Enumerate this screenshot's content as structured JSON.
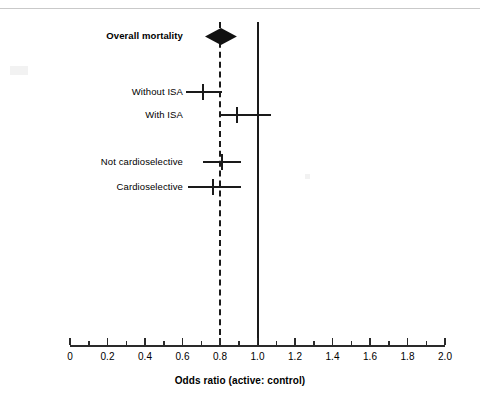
{
  "figure": {
    "background_color": "#ffffff",
    "line_color": "#1a1a1a"
  },
  "chart_data": {
    "type": "forest",
    "title": "",
    "xlabel": "Odds ratio (active: control)",
    "ylabel": "",
    "xlim": [
      0,
      2.0
    ],
    "grid": false,
    "legend": "none",
    "major_tick_step": 0.2,
    "minor_tick_step": 0.1,
    "tick_labels": [
      "0",
      "0.2",
      "0.4",
      "0.6",
      "0.8",
      "1.0",
      "1.2",
      "1.4",
      "1.6",
      "1.8",
      "2.0"
    ],
    "tick_values": [
      0,
      0.2,
      0.4,
      0.6,
      0.8,
      1.0,
      1.2,
      1.4,
      1.6,
      1.8,
      2.0
    ],
    "reference_lines": [
      {
        "name": "no-effect-line",
        "value": 1.0,
        "style": "solid"
      },
      {
        "name": "summary-effect-line",
        "value": 0.8,
        "style": "dashed"
      }
    ],
    "rows": [
      {
        "label": "Overall mortality",
        "marker": "diamond",
        "bold": true,
        "estimate": 0.8,
        "ci_low": 0.72,
        "ci_high": 0.89,
        "y": 36
      },
      {
        "label": "Without ISA",
        "marker": "line",
        "bold": false,
        "estimate": 0.71,
        "ci_low": 0.62,
        "ci_high": 0.81,
        "y": 92
      },
      {
        "label": "With ISA",
        "marker": "line",
        "bold": false,
        "estimate": 0.89,
        "ci_low": 0.8,
        "ci_high": 1.07,
        "y": 115
      },
      {
        "label": "Not cardioselective",
        "marker": "line",
        "bold": false,
        "estimate": 0.81,
        "ci_low": 0.71,
        "ci_high": 0.91,
        "y": 162
      },
      {
        "label": "Cardioselective",
        "marker": "line",
        "bold": false,
        "estimate": 0.76,
        "ci_low": 0.63,
        "ci_high": 0.91,
        "y": 187
      }
    ]
  }
}
